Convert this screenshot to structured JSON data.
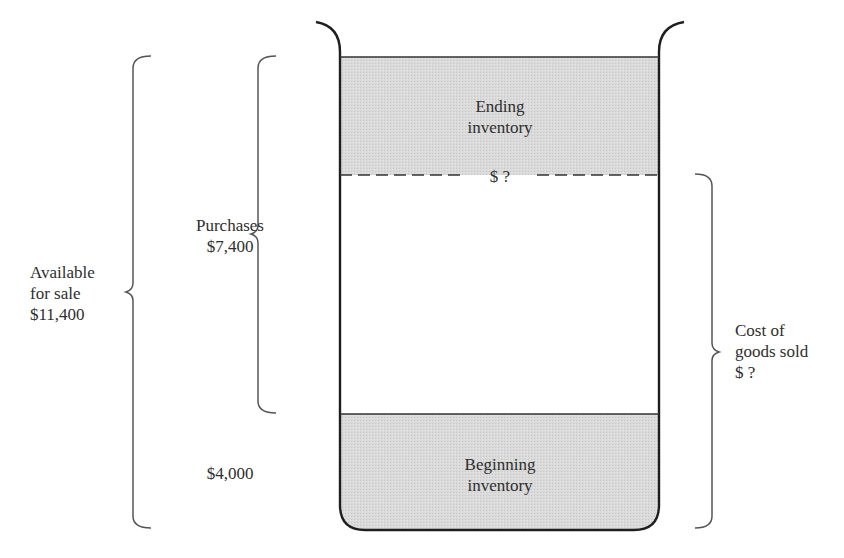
{
  "diagram": {
    "colors": {
      "fill_inventory": "#d9d9d9",
      "outline": "#1e1e1e",
      "brace": "#555555",
      "text": "#2e2e2e"
    },
    "container": {
      "ending_inventory": {
        "line1": "Ending",
        "line2": "inventory",
        "value": "$ ?"
      },
      "goods_sold_region": {
        "label": ""
      },
      "beginning_inventory": {
        "line1": "Beginning",
        "line2": "inventory"
      }
    },
    "braces": {
      "available_for_sale": {
        "line1": "Available",
        "line2": "for sale",
        "value": "$11,400"
      },
      "purchases": {
        "line1": "Purchases",
        "value": "$7,400"
      },
      "beginning_value": {
        "value": "$4,000"
      },
      "cost_of_goods_sold": {
        "line1": "Cost of",
        "line2": "goods sold",
        "value": "$ ?"
      }
    }
  }
}
